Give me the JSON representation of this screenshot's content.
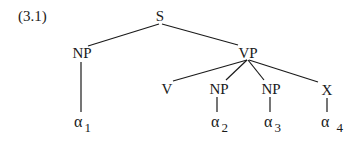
{
  "example_label": "(3.1)",
  "tree": {
    "root": "S",
    "nodes": [
      {
        "id": "S",
        "label": "S"
      },
      {
        "id": "NP1",
        "label": "NP"
      },
      {
        "id": "VP",
        "label": "VP"
      },
      {
        "id": "V",
        "label": "V"
      },
      {
        "id": "NP2",
        "label": "NP"
      },
      {
        "id": "NP3",
        "label": "NP"
      },
      {
        "id": "X",
        "label": "X"
      }
    ],
    "leaves": [
      {
        "id": "a1",
        "symbol": "α",
        "subscript": "1",
        "parent": "NP1"
      },
      {
        "id": "a2",
        "symbol": "α",
        "subscript": "2",
        "parent": "NP2"
      },
      {
        "id": "a3",
        "symbol": "α",
        "subscript": "3",
        "parent": "NP3"
      },
      {
        "id": "a4",
        "symbol": "α",
        "subscript": "4",
        "parent": "X"
      }
    ],
    "edges": [
      [
        "S",
        "NP1"
      ],
      [
        "S",
        "VP"
      ],
      [
        "VP",
        "V"
      ],
      [
        "VP",
        "NP2"
      ],
      [
        "VP",
        "NP3"
      ],
      [
        "VP",
        "X"
      ],
      [
        "NP1",
        "a1"
      ],
      [
        "NP2",
        "a2"
      ],
      [
        "NP3",
        "a3"
      ],
      [
        "X",
        "a4"
      ]
    ]
  }
}
